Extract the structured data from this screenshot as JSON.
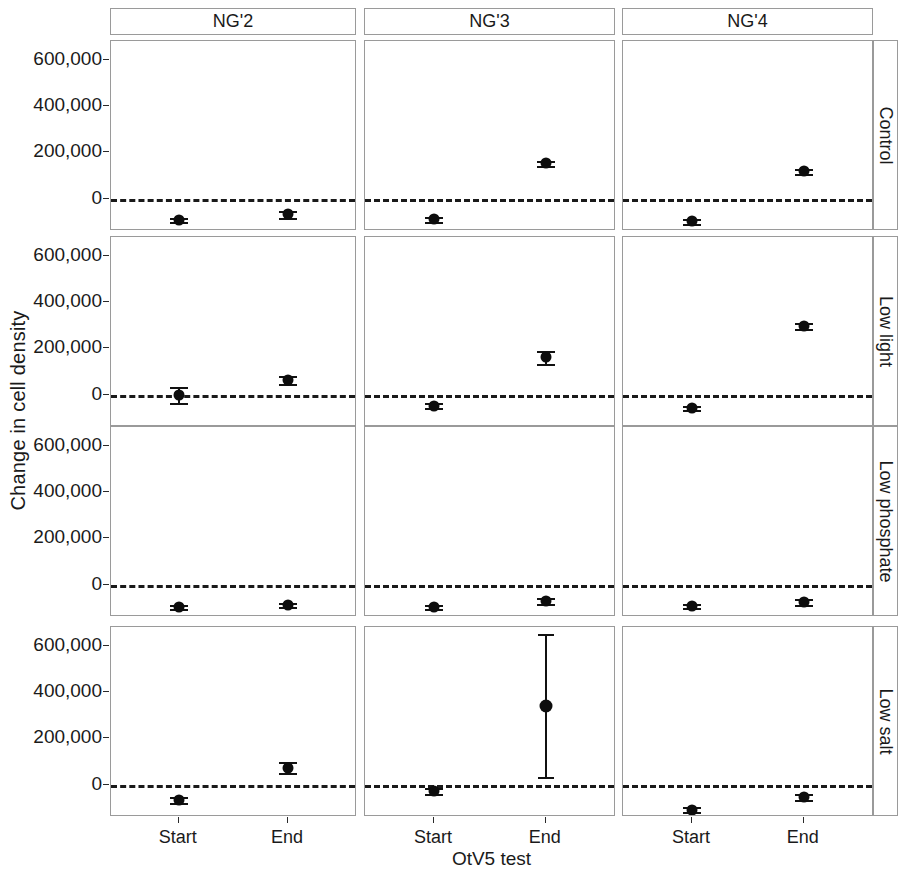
{
  "chart_data": {
    "type": "scatter",
    "title": "",
    "xlabel": "OtV5 test",
    "ylabel": "Change in cell density",
    "facet_columns": [
      "NG'2",
      "NG'3",
      "NG'4"
    ],
    "facet_rows": [
      "Control",
      "Low light",
      "Low phosphate",
      "Low salt"
    ],
    "categories": [
      "Start",
      "End"
    ],
    "x": [
      "Start",
      "End"
    ],
    "ylim": [
      -140000,
      680000
    ],
    "yticks": [
      0,
      200000,
      400000,
      600000
    ],
    "ytick_labels": [
      "0",
      "200,000",
      "400,000",
      "600,000"
    ],
    "grid": false,
    "legend": "none",
    "reference_line": {
      "y": 0,
      "style": "dashed"
    },
    "marker": "filled-circle",
    "error_bars": "mean +/- standard error",
    "panels": [
      {
        "row": "Control",
        "column": "NG'2",
        "points": [
          {
            "x": "Start",
            "y": -92000,
            "ylow": -100000,
            "yhigh": -84000
          },
          {
            "x": "End",
            "y": -68000,
            "ylow": -82000,
            "yhigh": -54000
          }
        ]
      },
      {
        "row": "Control",
        "column": "NG'3",
        "points": [
          {
            "x": "Start",
            "y": -90000,
            "ylow": -100000,
            "yhigh": -80000
          },
          {
            "x": "End",
            "y": 152000,
            "ylow": 140000,
            "yhigh": 164000
          }
        ]
      },
      {
        "row": "Control",
        "column": "NG'4",
        "points": [
          {
            "x": "Start",
            "y": -98000,
            "ylow": -108000,
            "yhigh": -88000
          },
          {
            "x": "End",
            "y": 118000,
            "ylow": 108000,
            "yhigh": 128000
          }
        ]
      },
      {
        "row": "Low light",
        "column": "NG'2",
        "points": [
          {
            "x": "Start",
            "y": -2000,
            "ylow": -36000,
            "yhigh": 34000
          },
          {
            "x": "End",
            "y": 62000,
            "ylow": 46000,
            "yhigh": 78000
          }
        ]
      },
      {
        "row": "Low light",
        "column": "NG'3",
        "points": [
          {
            "x": "Start",
            "y": -48000,
            "ylow": -58000,
            "yhigh": -38000
          },
          {
            "x": "End",
            "y": 162000,
            "ylow": 134000,
            "yhigh": 190000
          }
        ]
      },
      {
        "row": "Low light",
        "column": "NG'4",
        "points": [
          {
            "x": "Start",
            "y": -58000,
            "ylow": -68000,
            "yhigh": -48000
          },
          {
            "x": "End",
            "y": 296000,
            "ylow": 284000,
            "yhigh": 308000
          }
        ]
      },
      {
        "row": "Low phosphate",
        "column": "NG'2",
        "points": [
          {
            "x": "Start",
            "y": -98000,
            "ylow": -106000,
            "yhigh": -90000
          },
          {
            "x": "End",
            "y": -88000,
            "ylow": -98000,
            "yhigh": -78000
          }
        ]
      },
      {
        "row": "Low phosphate",
        "column": "NG'3",
        "points": [
          {
            "x": "Start",
            "y": -96000,
            "ylow": -104000,
            "yhigh": -88000
          },
          {
            "x": "End",
            "y": -72000,
            "ylow": -84000,
            "yhigh": -60000
          }
        ]
      },
      {
        "row": "Low phosphate",
        "column": "NG'4",
        "points": [
          {
            "x": "Start",
            "y": -92000,
            "ylow": -102000,
            "yhigh": -82000
          },
          {
            "x": "End",
            "y": -76000,
            "ylow": -90000,
            "yhigh": -62000
          }
        ]
      },
      {
        "row": "Low salt",
        "column": "NG'2",
        "points": [
          {
            "x": "Start",
            "y": -66000,
            "ylow": -78000,
            "yhigh": -54000
          },
          {
            "x": "End",
            "y": 72000,
            "ylow": 48000,
            "yhigh": 96000
          }
        ]
      },
      {
        "row": "Low salt",
        "column": "NG'3",
        "points": [
          {
            "x": "Start",
            "y": -28000,
            "ylow": -40000,
            "yhigh": -16000
          },
          {
            "x": "End",
            "y": 340000,
            "ylow": 32000,
            "yhigh": 650000
          }
        ]
      },
      {
        "row": "Low salt",
        "column": "NG'4",
        "points": [
          {
            "x": "Start",
            "y": -108000,
            "ylow": -118000,
            "yhigh": -98000
          },
          {
            "x": "End",
            "y": -54000,
            "ylow": -66000,
            "yhigh": -42000
          }
        ]
      }
    ]
  },
  "colors": {
    "point": "#0d0d0d",
    "panel_border": "#9a9a9a",
    "reference_line": "#1a1a1a",
    "background": "#ffffff",
    "text": "#1a1a1a"
  }
}
